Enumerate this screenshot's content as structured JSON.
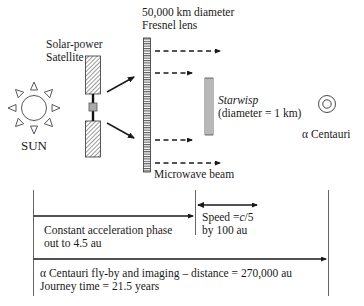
{
  "labels": {
    "lens_line1": "50,000 km diameter",
    "lens_line2": "Fresnel lens",
    "satellite_line1": "Solar-power",
    "satellite_line2": "Satellite",
    "sun": "SUN",
    "starwisp_name": "Starwisp",
    "starwisp_diameter": "(diameter = 1 km)",
    "target": "α Centauri",
    "beam": "Microwave beam",
    "phase1_line1": "Constant acceleration phase",
    "phase1_line2": "out to 4.5 au",
    "speed_line1": "Speed =c/5",
    "speed_line2": "by 100 au",
    "flyby_line1": "α Centauri fly-by and imaging – distance = 270,000 au",
    "flyby_line2": "Journey time = 21.5 years"
  },
  "icons": {
    "sun": "sun-icon",
    "satellite": "solar-panel-satellite-icon",
    "lens": "fresnel-lens-icon",
    "probe": "starwisp-sail-icon",
    "star": "concentric-circles-star-icon"
  },
  "colors": {
    "ink": "#1a1a1a",
    "hatch": "#555555",
    "connector": "#999999"
  }
}
